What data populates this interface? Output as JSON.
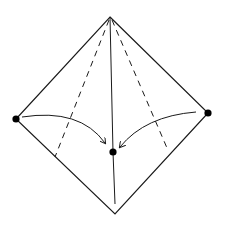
{
  "diagram": {
    "type": "fold-diagram-pyramid",
    "background": "#ffffff",
    "stroke_color": "#1a1a1a",
    "dot_color": "#000000",
    "points": {
      "apex": [
        110,
        17
      ],
      "left": [
        16,
        119
      ],
      "right": [
        208,
        113
      ],
      "bottom": [
        115,
        214
      ],
      "center": [
        113,
        152
      ]
    },
    "outline": [
      [
        110,
        17
      ],
      [
        208,
        113
      ],
      [
        115,
        214
      ],
      [
        16,
        119
      ]
    ],
    "solid_lines": [
      {
        "name": "center-ridge-line",
        "from": [
          110,
          17
        ],
        "to": [
          113,
          152
        ]
      },
      {
        "name": "center-lower-line",
        "from": [
          113,
          152
        ],
        "to": [
          115,
          204
        ]
      }
    ],
    "dashed_lines": [
      {
        "name": "left-dashed-fold",
        "from": [
          109,
          20
        ],
        "to": [
          55,
          157
        ]
      },
      {
        "name": "right-dashed-fold",
        "from": [
          112,
          20
        ],
        "to": [
          167,
          148
        ]
      }
    ],
    "arrows": [
      {
        "name": "left-fold-arrow",
        "path": "M 22 117 Q 80 108 105 143"
      },
      {
        "name": "right-fold-arrow",
        "path": "M 196 112 Q 145 116 120 147"
      }
    ],
    "dots": [
      {
        "name": "left-dot",
        "at": [
          16,
          119
        ]
      },
      {
        "name": "right-dot",
        "at": [
          208,
          113
        ]
      },
      {
        "name": "center-dot",
        "at": [
          113,
          152
        ]
      }
    ]
  }
}
